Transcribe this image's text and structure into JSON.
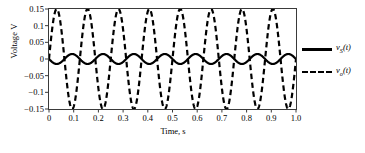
{
  "chart_data": {
    "type": "line",
    "title": "",
    "xlabel": "Time, s",
    "ylabel": "Voltage V",
    "xlim": [
      0,
      1.0
    ],
    "ylim": [
      -0.15,
      0.15
    ],
    "xticks": [
      "0",
      "0.1",
      "0.2",
      "0.3",
      "0.4",
      "0.5",
      "0.6",
      "0.7",
      "0.8",
      "0.9",
      "1.0"
    ],
    "xtick_values": [
      0,
      0.1,
      0.2,
      0.3,
      0.4,
      0.5,
      0.6,
      0.7,
      0.8,
      0.9,
      1.0
    ],
    "yticks": [
      "0.15",
      "0.1",
      "0.05",
      "0",
      "−0.05",
      "−0.1",
      "−0.15"
    ],
    "ytick_values": [
      0.15,
      0.1,
      0.05,
      0,
      -0.05,
      -0.1,
      -0.15
    ],
    "grid": false,
    "legend_position": "right-outside",
    "frequency_hz": 8,
    "series": [
      {
        "name": "vS(t)",
        "label_base": "v",
        "label_sub": "S",
        "label_tail": "(t)",
        "style": "solid",
        "color": "#000000",
        "linewidth": 2.2,
        "waveform": "sine",
        "amplitude": 0.015,
        "offset": 0.0,
        "phase_deg": 180,
        "cycles": 8
      },
      {
        "name": "vo(t)",
        "label_base": "v",
        "label_sub": "o",
        "label_tail": "(t)",
        "style": "dashed",
        "color": "#000000",
        "linewidth": 2.2,
        "waveform": "sine",
        "amplitude": 0.15,
        "offset": 0.0,
        "phase_deg": 0,
        "cycles": 8
      }
    ]
  },
  "axes": {
    "ylabel": "Voltage V",
    "xlabel": "Time, s"
  },
  "legend": {
    "entries": [
      {
        "text": "v",
        "sub": "S",
        "tail": "(t)",
        "style": "solid"
      },
      {
        "text": "v",
        "sub": "o",
        "tail": "(t)",
        "style": "dashed"
      }
    ]
  }
}
